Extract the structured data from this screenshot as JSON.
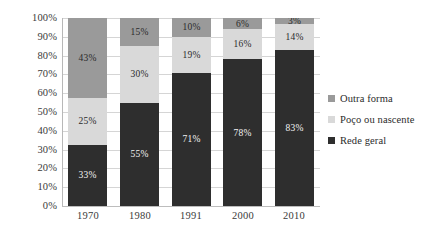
{
  "chart_data": {
    "type": "bar",
    "subtype": "100% stacked column",
    "title": "",
    "subtitle": "",
    "xlabel": "",
    "ylabel": "",
    "categories": [
      "1970",
      "1980",
      "1991",
      "2000",
      "2010"
    ],
    "series": [
      {
        "name": "Rede geral",
        "color": "#2e2e2e",
        "values": [
          33,
          55,
          71,
          78,
          83
        ],
        "labels": [
          "33%",
          "55%",
          "71%",
          "78%",
          "83%"
        ],
        "label_color": "on-dark"
      },
      {
        "name": "Poço ou nascente",
        "color": "#d9d9d9",
        "values": [
          25,
          30,
          19,
          16,
          14
        ],
        "labels": [
          "25%",
          "30%",
          "19%",
          "16%",
          "14%"
        ],
        "label_color": "on-light"
      },
      {
        "name": "Outra forma",
        "color": "#9a9a9a",
        "values": [
          43,
          15,
          10,
          6,
          3
        ],
        "labels": [
          "43%",
          "15%",
          "10%",
          "6%",
          "3%"
        ],
        "label_color": "on-light"
      }
    ],
    "stack_order_bottom_to_top": [
      "Rede geral",
      "Poço ou nascente",
      "Outra forma"
    ],
    "ylim": [
      0,
      100
    ],
    "ytick_values": [
      0,
      10,
      20,
      30,
      40,
      50,
      60,
      70,
      80,
      90,
      100
    ],
    "ytick_labels": [
      "0%",
      "10%",
      "20%",
      "30%",
      "40%",
      "50%",
      "60%",
      "70%",
      "80%",
      "90%",
      "100%"
    ],
    "grid": true,
    "legend_position": "right",
    "legend_entries": [
      {
        "label": "Outra forma",
        "color": "#9a9a9a"
      },
      {
        "label": "Poço ou nascente",
        "color": "#d9d9d9"
      },
      {
        "label": "Rede geral",
        "color": "#2e2e2e"
      }
    ]
  },
  "colors": {
    "background": "#ffffff",
    "gridline": "#d5d5d5",
    "axis": "#bdbdbd",
    "text": "#2b2b2b",
    "series_outra_forma": "#9a9a9a",
    "series_poco_ou_nascente": "#d9d9d9",
    "series_rede_geral": "#2e2e2e"
  }
}
